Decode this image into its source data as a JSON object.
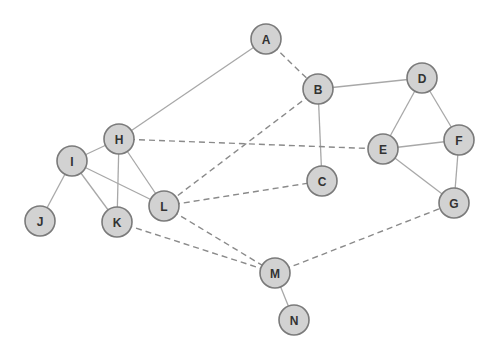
{
  "graph": {
    "nodes": [
      {
        "id": "A",
        "label": "A",
        "x": 266,
        "y": 39
      },
      {
        "id": "B",
        "label": "B",
        "x": 318,
        "y": 89
      },
      {
        "id": "C",
        "label": "C",
        "x": 322,
        "y": 181
      },
      {
        "id": "D",
        "label": "D",
        "x": 422,
        "y": 78
      },
      {
        "id": "E",
        "label": "E",
        "x": 383,
        "y": 149
      },
      {
        "id": "F",
        "label": "F",
        "x": 459,
        "y": 140
      },
      {
        "id": "G",
        "label": "G",
        "x": 454,
        "y": 203
      },
      {
        "id": "H",
        "label": "H",
        "x": 119,
        "y": 139
      },
      {
        "id": "I",
        "label": "I",
        "x": 72,
        "y": 161
      },
      {
        "id": "J",
        "label": "J",
        "x": 40,
        "y": 221
      },
      {
        "id": "K",
        "label": "K",
        "x": 117,
        "y": 222
      },
      {
        "id": "L",
        "label": "L",
        "x": 164,
        "y": 206
      },
      {
        "id": "M",
        "label": "M",
        "x": 275,
        "y": 273
      },
      {
        "id": "N",
        "label": "N",
        "x": 294,
        "y": 320
      }
    ],
    "edges": [
      {
        "from": "A",
        "to": "H",
        "style": "solid"
      },
      {
        "from": "A",
        "to": "B",
        "style": "dashed"
      },
      {
        "from": "B",
        "to": "D",
        "style": "solid"
      },
      {
        "from": "B",
        "to": "C",
        "style": "solid"
      },
      {
        "from": "B",
        "to": "L",
        "style": "dashed"
      },
      {
        "from": "D",
        "to": "E",
        "style": "solid"
      },
      {
        "from": "D",
        "to": "F",
        "style": "solid"
      },
      {
        "from": "E",
        "to": "F",
        "style": "solid"
      },
      {
        "from": "E",
        "to": "G",
        "style": "solid"
      },
      {
        "from": "F",
        "to": "G",
        "style": "solid"
      },
      {
        "from": "H",
        "to": "E",
        "style": "dashed"
      },
      {
        "from": "H",
        "to": "I",
        "style": "solid"
      },
      {
        "from": "H",
        "to": "K",
        "style": "solid"
      },
      {
        "from": "H",
        "to": "L",
        "style": "solid"
      },
      {
        "from": "I",
        "to": "J",
        "style": "solid"
      },
      {
        "from": "I",
        "to": "K",
        "style": "solid"
      },
      {
        "from": "I",
        "to": "L",
        "style": "solid"
      },
      {
        "from": "L",
        "to": "C",
        "style": "dashed"
      },
      {
        "from": "L",
        "to": "M",
        "style": "dashed"
      },
      {
        "from": "K",
        "to": "M",
        "style": "dashed"
      },
      {
        "from": "M",
        "to": "G",
        "style": "dashed"
      },
      {
        "from": "M",
        "to": "N",
        "style": "solid"
      }
    ],
    "node_radius": 15,
    "colors": {
      "node_fill": "#d2d2d2",
      "node_stroke": "#7a7a7a",
      "solid_edge": "#a8a8a8",
      "dashed_edge": "#8a8a8a",
      "label": "#333333"
    }
  }
}
